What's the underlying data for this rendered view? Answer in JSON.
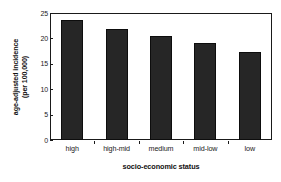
{
  "chart_data": {
    "type": "bar",
    "title": "",
    "categories": [
      "high",
      "high-mid",
      "medium",
      "mid-low",
      "low"
    ],
    "values": [
      23.7,
      21.9,
      20.4,
      19.1,
      17.3
    ],
    "series": [
      {
        "name": "age-adjusted incidence (per 100,000)",
        "values": [
          23.7,
          21.9,
          20.4,
          19.1,
          17.3
        ]
      }
    ],
    "xlabel": "socio-economic status",
    "ylabel_line1": "age-adjusted incidence",
    "ylabel_line2": "(per 100,000)",
    "ylim": [
      0,
      25
    ],
    "yticks": [
      0,
      5,
      10,
      15,
      20,
      25
    ],
    "ytick_labels": [
      "0",
      "5",
      "10",
      "15",
      "20",
      "25"
    ],
    "grid": false,
    "legend": false,
    "legend_position": "none",
    "bar_color": "#262626",
    "axis_color": "#1a1a1a",
    "background_color": "#ffffff"
  }
}
